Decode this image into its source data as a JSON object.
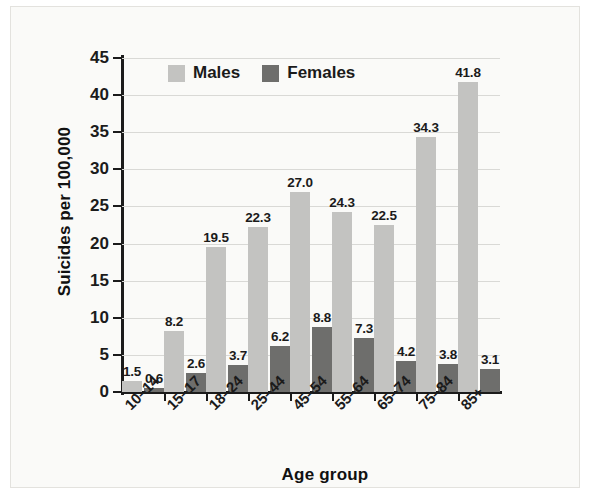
{
  "chart_data": {
    "type": "bar",
    "title": "",
    "xlabel": "Age group",
    "ylabel": "Suicides per 100,000",
    "ylim": [
      0,
      45
    ],
    "yticks": [
      0,
      5,
      10,
      15,
      20,
      25,
      30,
      35,
      40,
      45
    ],
    "ytick_labels": [
      "0",
      "5",
      "10",
      "15",
      "20",
      "25",
      "30",
      "35",
      "40",
      "45"
    ],
    "grid": true,
    "legend_position": "top-left-inside",
    "categories": [
      "10–14",
      "15–17",
      "18–24",
      "25–44",
      "45–54",
      "55–64",
      "65–74",
      "75–84",
      "85+"
    ],
    "series": [
      {
        "name": "Males",
        "color": "#c3c3c1",
        "values": [
          1.5,
          8.2,
          19.5,
          22.3,
          27.0,
          24.3,
          22.5,
          34.3,
          41.8
        ],
        "labels": [
          "1.5",
          "8.2",
          "19.5",
          "22.3",
          "27.0",
          "24.3",
          "22.5",
          "34.3",
          "41.8"
        ]
      },
      {
        "name": "Females",
        "color": "#6e6e6c",
        "values": [
          0.6,
          2.6,
          3.7,
          6.2,
          8.8,
          7.3,
          4.2,
          3.8,
          3.1
        ],
        "labels": [
          "0.6",
          "2.6",
          "3.7",
          "6.2",
          "8.8",
          "7.3",
          "4.2",
          "3.8",
          "3.1"
        ]
      }
    ]
  },
  "legend": {
    "items": [
      {
        "label": "Males",
        "color": "#c3c3c1"
      },
      {
        "label": "Females",
        "color": "#6e6e6c"
      }
    ]
  },
  "colors": {
    "males": "#c3c3c1",
    "females": "#6e6e6c",
    "axis": "#1b1b1b",
    "gridline": "#d9d9d6",
    "background": "#fafaf8"
  }
}
